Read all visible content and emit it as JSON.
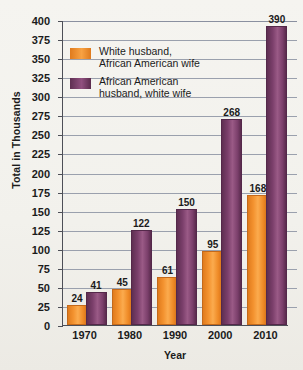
{
  "chart_data": {
    "type": "bar",
    "title": "",
    "xlabel": "Year",
    "ylabel": "Total in Thousands",
    "categories": [
      "1970",
      "1980",
      "1990",
      "2000",
      "2010"
    ],
    "ylim": [
      0,
      400
    ],
    "ytick_step": 25,
    "yticks": [
      0,
      25,
      50,
      75,
      100,
      125,
      150,
      175,
      200,
      225,
      250,
      275,
      300,
      325,
      350,
      375,
      400
    ],
    "grid": true,
    "legend_position": "upper-left-inside",
    "series": [
      {
        "name": "White husband,\nAfrican American wife",
        "color": "#f0892a",
        "values": [
          24,
          45,
          61,
          95,
          168
        ]
      },
      {
        "name": "African American\nhusband, white wife",
        "color": "#7b3f6b",
        "values": [
          41,
          122,
          150,
          268,
          390
        ]
      }
    ]
  },
  "legend": {
    "items": [
      {
        "label": "White husband,\nAfrican American wife",
        "color": "#f0892a"
      },
      {
        "label": "African American\nhusband, white wife",
        "color": "#7b3f6b"
      }
    ]
  }
}
